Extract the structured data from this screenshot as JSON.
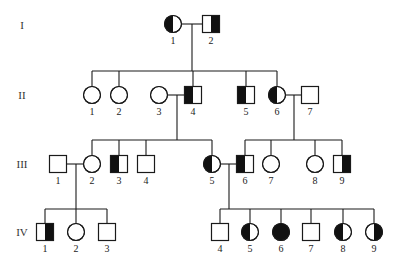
{
  "diagram": {
    "type": "pedigree",
    "colors": {
      "line": "#1a1a1a",
      "affected": "#111111",
      "background": "#ffffff"
    },
    "generations": [
      {
        "id": "I",
        "label": "I",
        "y": 25
      },
      {
        "id": "II",
        "label": "II",
        "y": 95
      },
      {
        "id": "III",
        "label": "III",
        "y": 164
      },
      {
        "id": "IV",
        "label": "IV",
        "y": 232
      }
    ],
    "individuals": [
      {
        "id": "I-1",
        "label": "1",
        "gen": "I",
        "sex": "female",
        "x": 173,
        "y": 24,
        "shading": "left"
      },
      {
        "id": "I-2",
        "label": "2",
        "gen": "I",
        "sex": "male",
        "x": 211,
        "y": 24,
        "shading": "right"
      },
      {
        "id": "II-1",
        "label": "1",
        "gen": "II",
        "sex": "female",
        "x": 92,
        "y": 95,
        "shading": "none"
      },
      {
        "id": "II-2",
        "label": "2",
        "gen": "II",
        "sex": "female",
        "x": 119,
        "y": 95,
        "shading": "none"
      },
      {
        "id": "II-3",
        "label": "3",
        "gen": "II",
        "sex": "female",
        "x": 159,
        "y": 95,
        "shading": "none"
      },
      {
        "id": "II-4",
        "label": "4",
        "gen": "II",
        "sex": "male",
        "x": 193,
        "y": 95,
        "shading": "left"
      },
      {
        "id": "II-5",
        "label": "5",
        "gen": "II",
        "sex": "male",
        "x": 246,
        "y": 95,
        "shading": "left"
      },
      {
        "id": "II-6",
        "label": "6",
        "gen": "II",
        "sex": "female",
        "x": 277,
        "y": 95,
        "shading": "left"
      },
      {
        "id": "II-7",
        "label": "7",
        "gen": "II",
        "sex": "male",
        "x": 310,
        "y": 95,
        "shading": "none"
      },
      {
        "id": "III-1",
        "label": "1",
        "gen": "III",
        "sex": "male",
        "x": 58,
        "y": 164,
        "shading": "none"
      },
      {
        "id": "III-2",
        "label": "2",
        "gen": "III",
        "sex": "female",
        "x": 92,
        "y": 164,
        "shading": "none"
      },
      {
        "id": "III-3",
        "label": "3",
        "gen": "III",
        "sex": "male",
        "x": 119,
        "y": 164,
        "shading": "left"
      },
      {
        "id": "III-4",
        "label": "4",
        "gen": "III",
        "sex": "male",
        "x": 146,
        "y": 164,
        "shading": "none"
      },
      {
        "id": "III-5",
        "label": "5",
        "gen": "III",
        "sex": "female",
        "x": 212,
        "y": 164,
        "shading": "left"
      },
      {
        "id": "III-6",
        "label": "6",
        "gen": "III",
        "sex": "male",
        "x": 245,
        "y": 164,
        "shading": "left"
      },
      {
        "id": "III-7",
        "label": "7",
        "gen": "III",
        "sex": "female",
        "x": 271,
        "y": 164,
        "shading": "none"
      },
      {
        "id": "III-8",
        "label": "8",
        "gen": "III",
        "sex": "female",
        "x": 315,
        "y": 164,
        "shading": "none"
      },
      {
        "id": "III-9",
        "label": "9",
        "gen": "III",
        "sex": "male",
        "x": 342,
        "y": 164,
        "shading": "right"
      },
      {
        "id": "IV-1",
        "label": "1",
        "gen": "IV",
        "sex": "male",
        "x": 45,
        "y": 232,
        "shading": "right"
      },
      {
        "id": "IV-2",
        "label": "2",
        "gen": "IV",
        "sex": "female",
        "x": 76,
        "y": 232,
        "shading": "none"
      },
      {
        "id": "IV-3",
        "label": "3",
        "gen": "IV",
        "sex": "male",
        "x": 107,
        "y": 232,
        "shading": "none"
      },
      {
        "id": "IV-4",
        "label": "4",
        "gen": "IV",
        "sex": "male",
        "x": 220,
        "y": 232,
        "shading": "none"
      },
      {
        "id": "IV-5",
        "label": "5",
        "gen": "IV",
        "sex": "female",
        "x": 250,
        "y": 232,
        "shading": "left"
      },
      {
        "id": "IV-6",
        "label": "6",
        "gen": "IV",
        "sex": "female",
        "x": 281,
        "y": 232,
        "shading": "full"
      },
      {
        "id": "IV-7",
        "label": "7",
        "gen": "IV",
        "sex": "male",
        "x": 311,
        "y": 232,
        "shading": "none"
      },
      {
        "id": "IV-8",
        "label": "8",
        "gen": "IV",
        "sex": "female",
        "x": 343,
        "y": 232,
        "shading": "left"
      },
      {
        "id": "IV-9",
        "label": "9",
        "gen": "IV",
        "sex": "female",
        "x": 374,
        "y": 232,
        "shading": "right"
      }
    ],
    "couples": [
      {
        "a": "I-1",
        "b": "I-2",
        "drop_x": 192,
        "sibship_y": 71,
        "children": [
          "II-1",
          "II-2",
          "II-4",
          "II-5",
          "II-6"
        ]
      },
      {
        "a": "II-3",
        "b": "II-4",
        "drop_x": 177,
        "sibship_y": 140,
        "children": [
          "III-2",
          "III-3",
          "III-4",
          "III-5"
        ]
      },
      {
        "a": "II-6",
        "b": "II-7",
        "drop_x": 294,
        "sibship_y": 140,
        "children": [
          "III-6",
          "III-7",
          "III-8",
          "III-9"
        ]
      },
      {
        "a": "III-1",
        "b": "III-2",
        "drop_x": 76,
        "sibship_y": 209,
        "children": [
          "IV-1",
          "IV-2",
          "IV-3"
        ]
      },
      {
        "a": "III-5",
        "b": "III-6",
        "drop_x": 229,
        "sibship_y": 209,
        "children": [
          "IV-4",
          "IV-5",
          "IV-6",
          "IV-7",
          "IV-8",
          "IV-9"
        ]
      }
    ]
  }
}
